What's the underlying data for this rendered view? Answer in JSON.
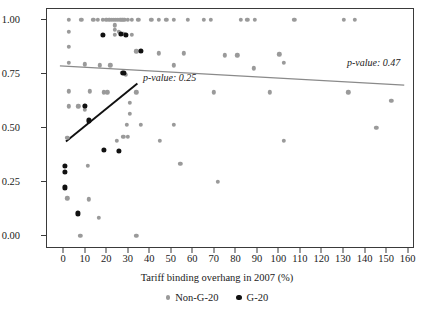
{
  "chart_data": {
    "type": "scatter",
    "title": "",
    "xlabel": "Tariff binding overhang in 2007 (%)",
    "ylabel": "",
    "xlim": [
      -8,
      163
    ],
    "ylim": [
      -0.06,
      1.05
    ],
    "xticks": [
      0,
      10,
      20,
      30,
      40,
      50,
      60,
      70,
      80,
      90,
      100,
      110,
      120,
      130,
      140,
      150,
      160
    ],
    "yticks": [
      0.0,
      0.25,
      0.5,
      0.75,
      1.0
    ],
    "ytick_labels": [
      "0.00",
      "0.25",
      "0.50",
      "0.75",
      "1.00"
    ],
    "grid": false,
    "legend_position": "bottom",
    "series": [
      {
        "name": "Non-G-20",
        "color": "#9a9a9a",
        "marker": "circle",
        "points": [
          [
            2.0,
            1.0
          ],
          [
            8.0,
            1.0
          ],
          [
            13.5,
            1.0
          ],
          [
            15.5,
            1.0
          ],
          [
            18.0,
            1.0
          ],
          [
            19.5,
            1.0
          ],
          [
            21.0,
            1.0
          ],
          [
            22.0,
            1.0
          ],
          [
            23.0,
            1.0
          ],
          [
            24.0,
            1.0
          ],
          [
            25.0,
            1.0
          ],
          [
            26.0,
            1.0
          ],
          [
            27.0,
            1.0
          ],
          [
            28.0,
            1.0
          ],
          [
            29.5,
            1.0
          ],
          [
            31.5,
            1.0
          ],
          [
            34.5,
            1.0
          ],
          [
            40.5,
            1.0
          ],
          [
            44.0,
            1.0
          ],
          [
            47.5,
            1.0
          ],
          [
            51.0,
            1.0
          ],
          [
            57.5,
            1.0
          ],
          [
            65.0,
            1.0
          ],
          [
            68.0,
            1.0
          ],
          [
            82.0,
            1.0
          ],
          [
            85.0,
            1.0
          ],
          [
            88.5,
            1.0
          ],
          [
            107.0,
            1.0
          ],
          [
            130.0,
            1.0
          ],
          [
            135.0,
            1.0
          ],
          [
            2.0,
            0.945
          ],
          [
            25.5,
            0.945
          ],
          [
            27.5,
            0.935
          ],
          [
            31.5,
            0.93
          ],
          [
            2.0,
            0.875
          ],
          [
            33.5,
            0.855
          ],
          [
            44.0,
            0.845
          ],
          [
            55.5,
            0.845
          ],
          [
            74.5,
            0.835
          ],
          [
            80.5,
            0.835
          ],
          [
            100.0,
            0.84
          ],
          [
            23.5,
            0.975
          ],
          [
            23.5,
            0.955
          ],
          [
            23.5,
            0.93
          ],
          [
            2.0,
            0.8
          ],
          [
            9.5,
            0.795
          ],
          [
            16.5,
            0.79
          ],
          [
            21.5,
            0.79
          ],
          [
            51.0,
            0.79
          ],
          [
            88.0,
            0.775
          ],
          [
            102.0,
            0.8
          ],
          [
            2.0,
            0.67
          ],
          [
            12.0,
            0.67
          ],
          [
            18.5,
            0.665
          ],
          [
            20.0,
            0.665
          ],
          [
            33.5,
            0.665
          ],
          [
            69.5,
            0.665
          ],
          [
            95.5,
            0.665
          ],
          [
            132.0,
            0.665
          ],
          [
            152.0,
            0.625
          ],
          [
            2.0,
            0.6
          ],
          [
            6.5,
            0.6
          ],
          [
            9.5,
            0.6
          ],
          [
            9.5,
            0.585
          ],
          [
            27.0,
            0.755
          ],
          [
            28.5,
            0.745
          ],
          [
            30.5,
            0.615
          ],
          [
            30.5,
            0.565
          ],
          [
            29.0,
            0.515
          ],
          [
            35.5,
            0.515
          ],
          [
            51.0,
            0.515
          ],
          [
            145.0,
            0.5
          ],
          [
            1.5,
            0.455
          ],
          [
            27.5,
            0.46
          ],
          [
            29.5,
            0.46
          ],
          [
            24.5,
            0.44
          ],
          [
            44.5,
            0.44
          ],
          [
            102.0,
            0.44
          ],
          [
            54.0,
            0.335
          ],
          [
            71.5,
            0.25
          ],
          [
            11.0,
            0.325
          ],
          [
            11.5,
            0.17
          ],
          [
            1.5,
            0.175
          ],
          [
            16.0,
            0.085
          ],
          [
            7.5,
            0.0
          ],
          [
            33.5,
            0.0
          ]
        ]
      },
      {
        "name": "G-20",
        "color": "#111111",
        "marker": "circle",
        "points": [
          [
            18.0,
            0.93
          ],
          [
            26.5,
            0.935
          ],
          [
            28.5,
            0.93
          ],
          [
            35.5,
            0.855
          ],
          [
            27.5,
            0.755
          ],
          [
            9.5,
            0.6
          ],
          [
            11.5,
            0.535
          ],
          [
            18.5,
            0.4
          ],
          [
            25.5,
            0.395
          ],
          [
            0.5,
            0.325
          ],
          [
            0.5,
            0.295
          ],
          [
            0.5,
            0.225
          ],
          [
            6.5,
            0.105
          ]
        ]
      }
    ],
    "trendlines": [
      {
        "name": "Non-G-20 trend",
        "color": "#8a8a8a",
        "x0": -2.0,
        "y0": 0.787,
        "x1": 158.0,
        "y1": 0.698,
        "annotation": "p-value: 0.47"
      },
      {
        "name": "G-20 trend",
        "color": "#111111",
        "x0": 0.8,
        "y0": 0.437,
        "x1": 34.0,
        "y1": 0.705,
        "annotation": "p-value: 0.25"
      }
    ],
    "annotations": [
      {
        "text": "p-value: 0.25",
        "x_px": 143,
        "y_px": 72
      },
      {
        "text": "p-value: 0.47",
        "x_px": 347,
        "y_px": 57
      }
    ]
  },
  "legend": {
    "items": [
      {
        "label": "Non-G-20",
        "marker": "ng"
      },
      {
        "label": "G-20",
        "marker": "g"
      }
    ]
  }
}
